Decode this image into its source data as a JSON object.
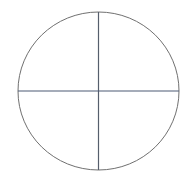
{
  "figure": {
    "name": "circle-divided-into-four-quadrants",
    "kind": "geometric-diagram"
  },
  "colors": {
    "background": "#ffffff",
    "circle_stroke": "#707070",
    "vertical_line": "#565e6c",
    "horizontal_line": "#4d5a74"
  }
}
